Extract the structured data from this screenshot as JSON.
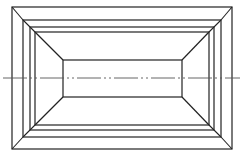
{
  "diagram": {
    "type": "technical-drawing",
    "colors": {
      "line": "#222222",
      "centerline": "#555555",
      "background": "#ffffff"
    },
    "frames": [
      {
        "name": "outer-frame",
        "x1": 12,
        "y1": 7,
        "x2": 232,
        "y2": 149
      },
      {
        "name": "second-frame",
        "x1": 23,
        "y1": 20,
        "x2": 221,
        "y2": 137
      },
      {
        "name": "third-frame",
        "x1": 30,
        "y1": 27,
        "x2": 214,
        "y2": 130
      },
      {
        "name": "frustum-base",
        "x1": 35,
        "y1": 32,
        "x2": 209,
        "y2": 125
      }
    ],
    "frustum_top": {
      "x1": 63,
      "y1": 60,
      "x2": 182,
      "y2": 97
    },
    "centerline": {
      "y": 78,
      "x1": 3,
      "x2": 240,
      "style": "dash-dot-dot"
    }
  }
}
